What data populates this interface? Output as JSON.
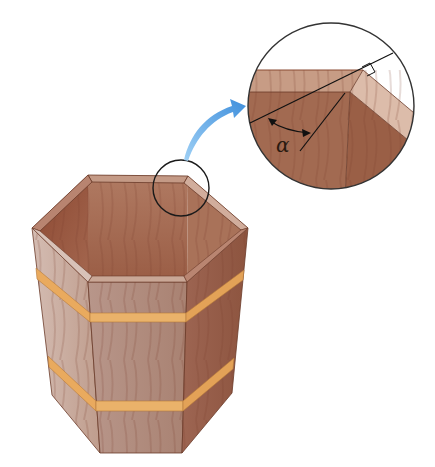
{
  "figure": {
    "magnifier": {
      "angle_label": "α",
      "right_angle_marker": true
    },
    "colors": {
      "background": "#ffffff",
      "wood_dark": "#8e4e36",
      "wood_mid": "#a86e54",
      "wood_light": "#c9a999",
      "wood_outside": "#b48a79",
      "band": "#e8a85c",
      "arrow": "#5aa7e6",
      "outline": "#222222"
    }
  }
}
